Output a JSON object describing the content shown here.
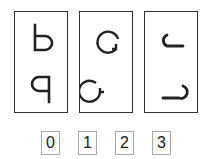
{
  "puzzle": {
    "panels": [
      {
        "top_symbol": "letter-b",
        "bottom_symbol": "letter-q"
      },
      {
        "top_symbol": "circle-arrow-clockwise",
        "bottom_symbol": "circle-arrow-counterclockwise"
      },
      {
        "top_symbol": "hook-curve-left",
        "bottom_symbol": "hook-curve-right"
      }
    ],
    "options": [
      "0",
      "1",
      "2",
      "3"
    ]
  }
}
